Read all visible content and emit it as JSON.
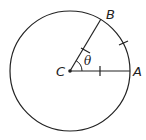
{
  "diagram": {
    "type": "circle-sector",
    "labels": {
      "center": "C",
      "point_a": "A",
      "point_b": "B",
      "angle": "θ"
    }
  }
}
